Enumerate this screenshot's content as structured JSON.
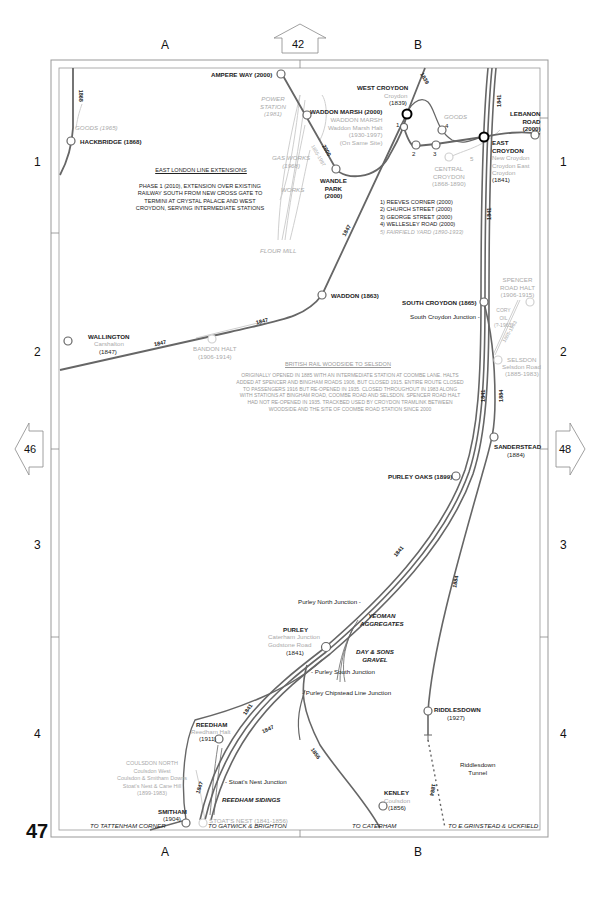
{
  "page_number": "47",
  "grid": {
    "columns": [
      "A",
      "B"
    ],
    "rows": [
      "1",
      "2",
      "3",
      "4"
    ]
  },
  "adjacent_pages": {
    "top": "42",
    "left": "46",
    "right": "48"
  },
  "notes": {
    "east_london_title": "EAST LONDON LINE EXTENSIONS",
    "east_london_body": "PHASE 1 (2010), EXTENSION OVER EXISTING RAILWAY SOUTH FROM NEW CROSS GATE TO TERMINI AT CRYSTAL PALACE AND WEST CROYDON, SERVING INTERMEDIATE STATIONS",
    "woodside_title": "BRITISH RAIL WOODSIDE TO SELSDON",
    "woodside_body": "ORIGINALLY OPENED IN 1885 WITH AN INTERMEDIATE STATION AT COOMBE LANE. HALTS ADDED AT SPENCER AND BINGHAM ROADS 1906, BUT CLOSED 1915. ENTIRE ROUTE CLOSED TO PASSENGERS 1916 BUT RE-OPENED IN 1935. CLOSED THROUGHOUT IN 1983 ALONG WITH STATIONS AT BINGHAM ROAD, COOMBE ROAD AND SELSDON. SPENCER ROAD HALT HAD NOT RE-OPENED IN 1935. TRACKBED USED BY CROYDON TRAMLINK BETWEEN WOODSIDE AND THE SITE OF COOMBE ROAD STATION SINCE 2000",
    "tram_stops": [
      "1) REEVES CORNER (2000)",
      "2) CHURCH STREET (2000)",
      "3) GEORGE STREET (2000)",
      "4) WELLESLEY ROAD (2000)",
      "5) FAIRFIELD YARD (1890-1933)"
    ]
  },
  "stations": {
    "ampere_way": "AMPERE WAY (2000)",
    "hackbridge": "HACKBRIDGE (1868)",
    "goods_1965": "GOODS (1965)",
    "power_station": [
      "POWER",
      "STATION",
      "(1981)"
    ],
    "waddon_marsh": "WADDON MARSH (2000)",
    "waddon_marsh_old": [
      "WADDON MARSH",
      "Waddon Marsh Halt",
      "(1930-1997)",
      "(On Same Site)"
    ],
    "gas_works": [
      "GAS WORKS",
      "(1968)"
    ],
    "works": "WORKS",
    "flour_mill": "FLOUR MILL",
    "wandle_park": [
      "WANDLE",
      "PARK",
      "(2000)"
    ],
    "west_croydon": "WEST CROYDON",
    "west_croydon_alt": "Croydon",
    "west_croydon_year": "(1839)",
    "goods": "GOODS",
    "central_croydon": [
      "CENTRAL",
      "CROYDON",
      "(1868-1890)"
    ],
    "lebanon_road": [
      "LEBANON",
      "ROAD",
      "(2000)"
    ],
    "east_croydon": [
      "EAST",
      "CROYDON"
    ],
    "east_croydon_alt": [
      "New Croydon",
      "Croydon East",
      "Croydon"
    ],
    "east_croydon_year": "(1841)",
    "waddon": "WADDON (1863)",
    "wallington": "WALLINGTON",
    "wallington_alt": "Carshalton",
    "wallington_year": "(1847)",
    "bandon_halt": [
      "BANDON HALT",
      "(1906-1914)"
    ],
    "south_croydon": "SOUTH CROYDON (1865)",
    "south_croydon_jn": "South Croydon Junction -",
    "spencer_road": [
      "SPENCER",
      "ROAD HALT",
      "(1906-1915)"
    ],
    "cory_oil": [
      "CORY",
      "OIL",
      "(?-1963)"
    ],
    "selsdon": "SELSDON",
    "selsdon_alt": "Selsdon Road",
    "selsdon_year": "(1885-1983)",
    "sanderstead": "SANDERSTEAD",
    "sanderstead_year": "(1884)",
    "purley_oaks": "PURLEY OAKS (1899)",
    "purley_north_jn": "Purley North Junction -",
    "yeoman": [
      "YEOMAN",
      "AGGREGATES"
    ],
    "day_sons": [
      "DAY & SONS",
      "GRAVEL"
    ],
    "purley": "PURLEY",
    "purley_alt": [
      "Caterham Junction",
      "Godstone Road"
    ],
    "purley_year": "(1841)",
    "purley_south_jn": "- Purley South Junction",
    "purley_chipstead_jn": "- Purley Chipstead Line Junction",
    "riddlesdown": "RIDDLESDOWN",
    "riddlesdown_year": "(1927)",
    "riddlesdown_tunnel": [
      "Riddlesdown",
      "Tunnel"
    ],
    "reedham": "REEDHAM",
    "reedham_alt": "Reedham Halt",
    "reedham_year": "(1911)",
    "coulsdon_north": [
      "COULSDON NORTH",
      "Coulsdon West",
      "Coulsdon & Smitham Downs",
      "Stoat's Nest & Cane Hill",
      "(1899-1983)"
    ],
    "stoats_nest_jn": "- Stoat's Nest Junction",
    "reedham_sidings": "REEDHAM SIDINGS",
    "smitham": "SMITHAM",
    "smitham_year": "(1904)",
    "stoats_nest": "STOAT'S NEST (1841-1856)",
    "kenley": "KENLEY",
    "kenley_alt": "Coulsdon",
    "kenley_year": "(1856)"
  },
  "destinations": {
    "tattenham": "TO TATTENHAM CORNER",
    "gatwick": "TO GATWICK & BRIGHTON",
    "caterham": "TO CATERHAM",
    "grinstead": "TO E.GRINSTEAD & UCKFIELD"
  },
  "line_years": {
    "y1868": "1868",
    "y1839": "1839",
    "y1841": "1841",
    "y2000": "2000",
    "y1855": "1855-1997",
    "y1847": "1847",
    "y1884": "1884",
    "y1856": "1856",
    "y1885": "1885-1983"
  },
  "colors": {
    "track": "#666666",
    "disused": "#c8c8c8",
    "frame": "#888888",
    "text": "#222222",
    "historic_text": "#aaaaaa"
  }
}
